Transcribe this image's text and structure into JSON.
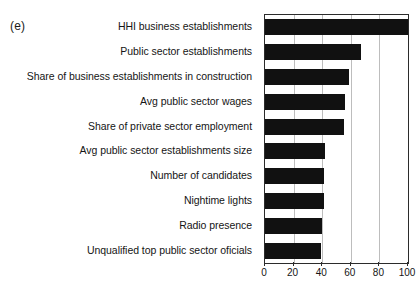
{
  "panel": {
    "label": "(e)"
  },
  "title_remnant": {
    "text": ""
  },
  "chart_data": {
    "type": "bar",
    "orientation": "horizontal",
    "title": "",
    "subtitle": "",
    "xlabel": "",
    "ylabel": "",
    "xlim": [
      0,
      100
    ],
    "grid": true,
    "legend": false,
    "bar_color": "#111111",
    "frame_color": "#2b2b2b",
    "gridline_color": "#bdbdbd",
    "xticks": [
      0,
      20,
      40,
      60,
      80,
      100
    ],
    "xticklabels": [
      "0",
      "20",
      "40",
      "60",
      "80",
      "100"
    ],
    "categories": [
      "HHI business establishments",
      "Public sector establishments",
      "Share of business establishments in construction",
      "Avg public sector wages",
      "Share of private sector employment",
      "Avg public sector establishments size",
      "Number of candidates",
      "Nightime lights",
      "Radio presence",
      "Unqualified top public sector oficials"
    ],
    "values": [
      100,
      67,
      59,
      56,
      55,
      42,
      41,
      41,
      40,
      39
    ]
  }
}
